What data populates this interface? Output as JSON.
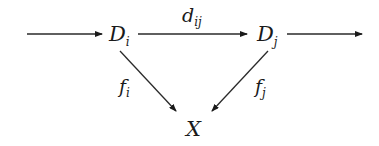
{
  "diagram": {
    "nodes": {
      "di": {
        "label": "D",
        "subscript": "i"
      },
      "dj": {
        "label": "D",
        "subscript": "j"
      },
      "x": {
        "label": "X"
      }
    },
    "edges": {
      "incoming": {
        "from": "",
        "to": "D_i",
        "label": ""
      },
      "dij": {
        "from": "D_i",
        "to": "D_j",
        "label": "d",
        "subscript": "ij"
      },
      "outgoing": {
        "from": "D_j",
        "to": "",
        "label": ""
      },
      "fi": {
        "from": "D_i",
        "to": "X",
        "label": "f",
        "subscript": "i"
      },
      "fj": {
        "from": "D_j",
        "to": "X",
        "label": "f",
        "subscript": "j"
      }
    }
  }
}
